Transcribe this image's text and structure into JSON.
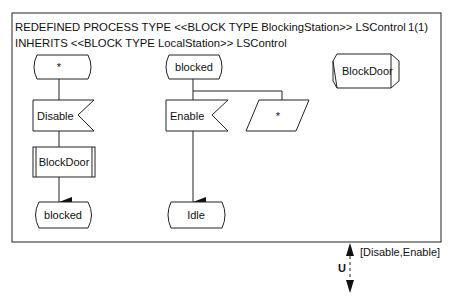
{
  "header": {
    "line1": "REDEFINED PROCESS TYPE <<BLOCK TYPE BlockingStation>> LSControl",
    "line2": "INHERITS <<BLOCK TYPE LocalStation>> LSControl",
    "page": "1(1)"
  },
  "column1": {
    "start_state": "*",
    "input_signal": "Disable",
    "procedure_call": "BlockDoor",
    "next_state": "blocked"
  },
  "column2": {
    "start_state": "blocked",
    "input_signal": "Enable",
    "save_symbol": "*",
    "next_state": "Idle"
  },
  "procedure_reference": "BlockDoor",
  "gate": {
    "name": "U",
    "signals": "[Disable,Enable]"
  }
}
